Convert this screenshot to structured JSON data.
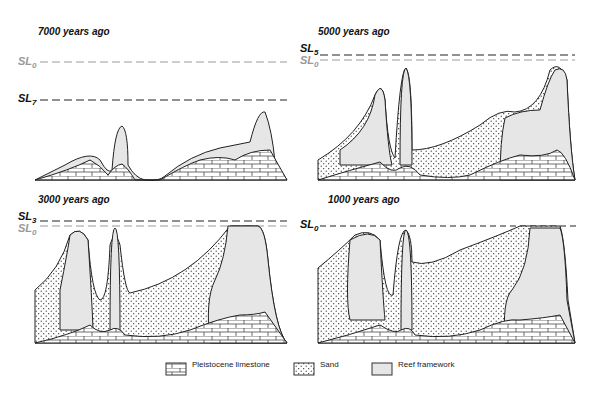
{
  "panels": [
    {
      "title": "7000 years ago",
      "sea_levels": [
        {
          "label": "SL",
          "sub": "0",
          "style": "grey"
        },
        {
          "label": "SL",
          "sub": "7",
          "style": "dark"
        }
      ]
    },
    {
      "title": "5000 years ago",
      "sea_levels": [
        {
          "label": "SL",
          "sub": "5",
          "style": "dark"
        },
        {
          "label": "SL",
          "sub": "0",
          "style": "grey"
        }
      ]
    },
    {
      "title": "3000 years ago",
      "sea_levels": [
        {
          "label": "SL",
          "sub": "3",
          "style": "dark"
        },
        {
          "label": "SL",
          "sub": "0",
          "style": "grey"
        }
      ]
    },
    {
      "title": "1000 years ago",
      "sea_levels": [
        {
          "label": "SL",
          "sub": "0",
          "style": "dark"
        }
      ]
    }
  ],
  "legend": [
    {
      "label": "Pleistocene limestone",
      "pattern": "brick"
    },
    {
      "label": "Sand",
      "pattern": "dots"
    },
    {
      "label": "Reef framework",
      "pattern": "reef"
    }
  ],
  "colors": {
    "reef_fill": "#e6e6e6",
    "line": "#222222",
    "sl_grey": "#999999"
  }
}
